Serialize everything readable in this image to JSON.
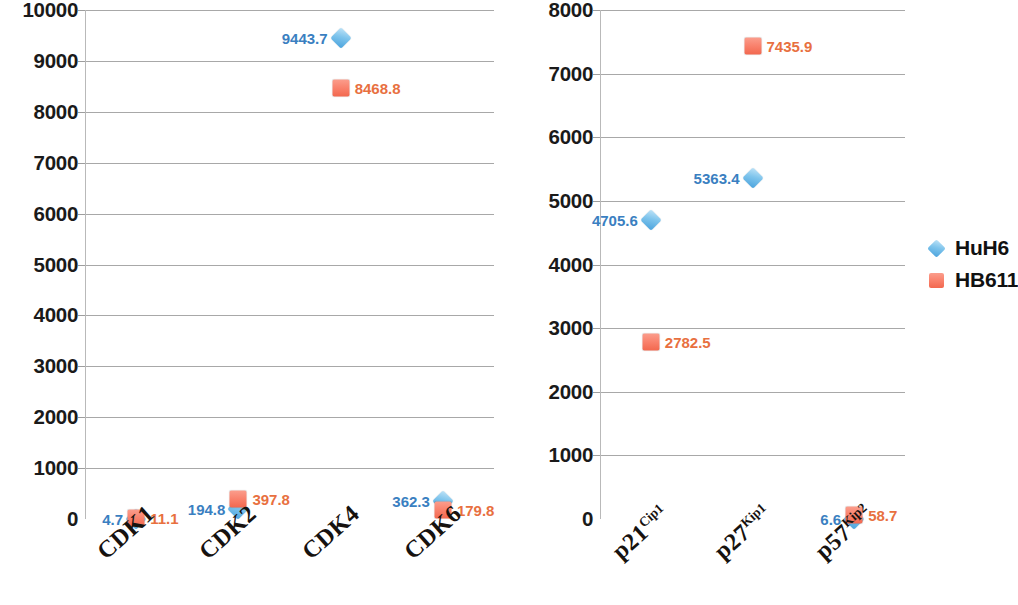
{
  "chart_data": [
    {
      "type": "scatter",
      "panel": "left",
      "title": "",
      "xlabel": "",
      "ylabel": "",
      "ylim": [
        0,
        10000
      ],
      "ytick_labels": [
        "10000",
        "9000",
        "8000",
        "7000",
        "6000",
        "5000",
        "4000",
        "3000",
        "2000",
        "1000",
        "0"
      ],
      "ytick_values": [
        10000,
        9000,
        8000,
        7000,
        6000,
        5000,
        4000,
        3000,
        2000,
        1000,
        0
      ],
      "grid": true,
      "legend_position": "none",
      "categories": [
        "CDK1",
        "CDK2",
        "CDK4",
        "CDK6"
      ],
      "category_html": [
        "CDK1",
        "CDK2",
        "CDK4",
        "CDK6"
      ],
      "series": [
        {
          "name": "HuH6",
          "color": "#7ec4ec",
          "label_color": "#3a7fc1",
          "marker": "diamond",
          "values": [
            4.7,
            194.8,
            9443.7,
            362.3
          ],
          "value_labels": [
            "4.7",
            "194.8",
            "9443.7",
            "362.3"
          ],
          "label_side": [
            "left",
            "left",
            "left",
            "left"
          ]
        },
        {
          "name": "HB611",
          "color": "#f9816c",
          "label_color": "#e8703f",
          "marker": "square",
          "values": [
            11.1,
            397.8,
            8468.8,
            179.8
          ],
          "value_labels": [
            "11.1",
            "397.8",
            "8468.8",
            "179.8"
          ],
          "label_side": [
            "right",
            "right",
            "right",
            "right"
          ]
        }
      ]
    },
    {
      "type": "scatter",
      "panel": "right",
      "title": "",
      "xlabel": "",
      "ylabel": "",
      "ylim": [
        0,
        8000
      ],
      "ytick_labels": [
        "8000",
        "7000",
        "6000",
        "5000",
        "4000",
        "3000",
        "2000",
        "1000",
        "0"
      ],
      "ytick_values": [
        8000,
        7000,
        6000,
        5000,
        4000,
        3000,
        2000,
        1000,
        0
      ],
      "grid": true,
      "legend_position": "right",
      "categories": [
        "p21Cip1",
        "p27Kip1",
        "p57Kip2"
      ],
      "category_html": [
        "p21<sup>Cip1</sup>",
        "p27<sup>Kip1</sup>",
        "p57<sup>Kip2</sup>"
      ],
      "series": [
        {
          "name": "HuH6",
          "color": "#7ec4ec",
          "label_color": "#3a7fc1",
          "marker": "diamond",
          "values": [
            4705.6,
            5363.4,
            6.6
          ],
          "value_labels": [
            "4705.6",
            "5363.4",
            "6.6"
          ],
          "label_side": [
            "left",
            "left",
            "left"
          ]
        },
        {
          "name": "HB611",
          "color": "#f9816c",
          "label_color": "#e8703f",
          "marker": "square",
          "values": [
            2782.5,
            7435.9,
            58.7
          ],
          "value_labels": [
            "2782.5",
            "7435.9",
            "58.7"
          ],
          "label_side": [
            "right",
            "right",
            "right"
          ]
        }
      ]
    }
  ],
  "legend": {
    "entries": [
      {
        "label": "HuH6",
        "marker": "diamond",
        "color": "#7ec4ec"
      },
      {
        "label": "HB611",
        "marker": "square",
        "color": "#f9816c"
      }
    ]
  },
  "colors": {
    "huh6_marker": "#7ec4ec",
    "huh6_label": "#3a7fc1",
    "hb611_marker": "#f9816c",
    "hb611_label": "#e8703f",
    "gridline": "#a8a8a8",
    "axis": "#b9b9b9",
    "tick_text": "#1a1a1a"
  }
}
